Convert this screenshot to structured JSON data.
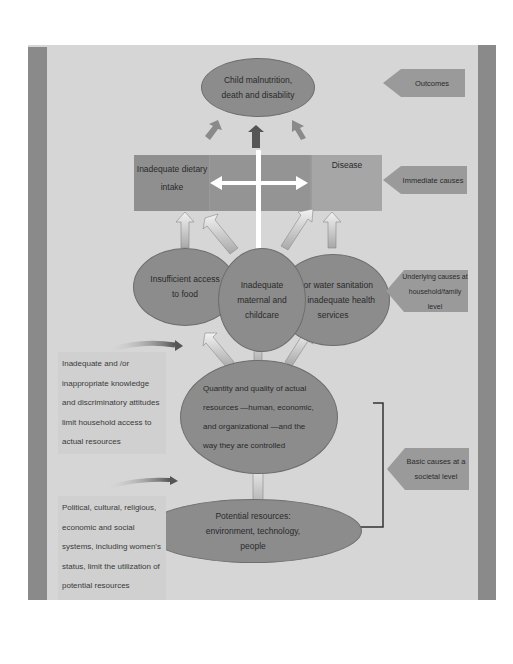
{
  "diagram": {
    "outcome": "Child malnutrition, death and disability",
    "immediate": {
      "left": "Inadequate dietary intake",
      "right": "Disease"
    },
    "underlying": {
      "food": "Insufficient access to food",
      "care": "Inadequate maternal and childcare",
      "water": "Poor water sanitation and inadequate health services"
    },
    "resources": "Quantity and quality of actual resources —human, economic, and organizational —and the way they are controlled",
    "potential": "Potential resources: environment, technology, people",
    "levels": {
      "outcomes": "Outcomes",
      "immediate": "Immediate causes",
      "underlying": "Underlying causes at household/family level",
      "basic": "Basic causes at a societal level"
    },
    "side_notes": {
      "knowledge": "Inadequate and /or inappropriate knowledge and discriminatory attitudes limit household access to actual resources",
      "political": "Political, cultural, religious, economic and social systems, including women's status, limit the utilization of potential resources"
    },
    "colors": {
      "background": "#d6d6d6",
      "frame_bar": "#8a8a8a",
      "node": "#8c8c8c",
      "tag": "#9a9a9a"
    }
  }
}
